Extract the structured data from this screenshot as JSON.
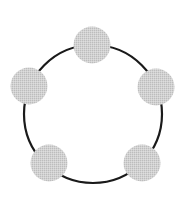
{
  "diagram": {
    "type": "ring-topology",
    "canvas": {
      "width": 178,
      "height": 197
    },
    "background": "#ffffff",
    "ring": {
      "cx": 93,
      "cy": 114,
      "r": 69,
      "stroke": "#1a1a1a",
      "stroke_width": 2.2
    },
    "node_style": {
      "r": 18.5,
      "fill": "#d2d2d2",
      "dither": "#bdbdbd"
    },
    "nodes": [
      {
        "id": "node-top",
        "cx": 92,
        "cy": 45
      },
      {
        "id": "node-right",
        "cx": 156,
        "cy": 87
      },
      {
        "id": "node-bottom-right",
        "cx": 142,
        "cy": 163
      },
      {
        "id": "node-bottom-left",
        "cx": 49,
        "cy": 163
      },
      {
        "id": "node-left",
        "cx": 29,
        "cy": 86
      }
    ]
  }
}
